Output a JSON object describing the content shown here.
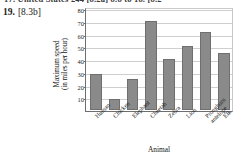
{
  "page": {
    "top_clipped_text": "17. United States      244  [8.2a]  8.8 to      18.  [8.2",
    "exercise_number": "19.",
    "exercise_tag": "[8.3b]"
  },
  "chart_data": {
    "type": "bar",
    "title": "",
    "xlabel": "Animal",
    "ylabel": "Maximum speed (in miles per hour)",
    "ylabel_line1": "Maximum speed",
    "ylabel_line2": "(in miles per hour)",
    "categories": [
      "Human",
      "Chicken",
      "Elephant",
      "Cheetah",
      "Zebra",
      "Lion",
      "Pronghorn antelope",
      "Elk"
    ],
    "values": [
      28,
      9,
      24,
      70,
      40,
      50,
      61,
      45
    ],
    "ylim": [
      0,
      80
    ],
    "yticks": [
      10,
      20,
      30,
      40,
      50,
      60,
      70,
      80
    ],
    "ytick_labels": [
      "10",
      "20",
      "30",
      "40",
      "50",
      "60",
      "70",
      "80"
    ],
    "grid": true,
    "legend": "none",
    "bar_color": "#8a8a8a",
    "bar_edge_color": "#6f6f6f",
    "axis_color": "#6e6e6e",
    "grid_color": "#cfcfcf"
  }
}
